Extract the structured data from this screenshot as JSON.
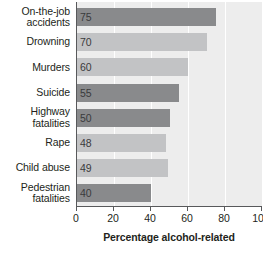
{
  "chart_data": {
    "type": "bar",
    "orientation": "horizontal",
    "title": "",
    "xlabel": "Percentage alcohol-related",
    "ylabel": "",
    "xlim": [
      0,
      100
    ],
    "xticks": [
      0,
      20,
      40,
      60,
      80,
      100
    ],
    "xticklabels": [
      "0",
      "20",
      "40",
      "60",
      "80",
      "100"
    ],
    "grid": "vertical-white-gridlines",
    "legend": "none",
    "categories": [
      "On-the-job accidents",
      "Drowning",
      "Murders",
      "Suicide",
      "Highway fatalities",
      "Rape",
      "Child abuse",
      "Pedestrian fatalities"
    ],
    "category_lines": [
      [
        "On-the-job",
        "accidents"
      ],
      [
        "Drowning"
      ],
      [
        "Murders"
      ],
      [
        "Suicide"
      ],
      [
        "Highway",
        "fatalities"
      ],
      [
        "Rape"
      ],
      [
        "Child abuse"
      ],
      [
        "Pedestrian",
        "fatalities"
      ]
    ],
    "values": [
      75,
      70,
      60,
      55,
      50,
      48,
      49,
      40
    ],
    "value_labels": [
      "75",
      "70",
      "60",
      "55",
      "50",
      "48",
      "49",
      "40"
    ],
    "bar_shades": [
      "dark",
      "light",
      "light",
      "dark",
      "dark",
      "light",
      "light",
      "dark"
    ],
    "colors": {
      "bar_dark": "#898a8c",
      "bar_light": "#c2c3c5",
      "plot_background": "#ededed",
      "gridline": "#ffffff",
      "axis": "#58595b",
      "text": "#231f20",
      "value_label": "#3a3a3c"
    }
  }
}
